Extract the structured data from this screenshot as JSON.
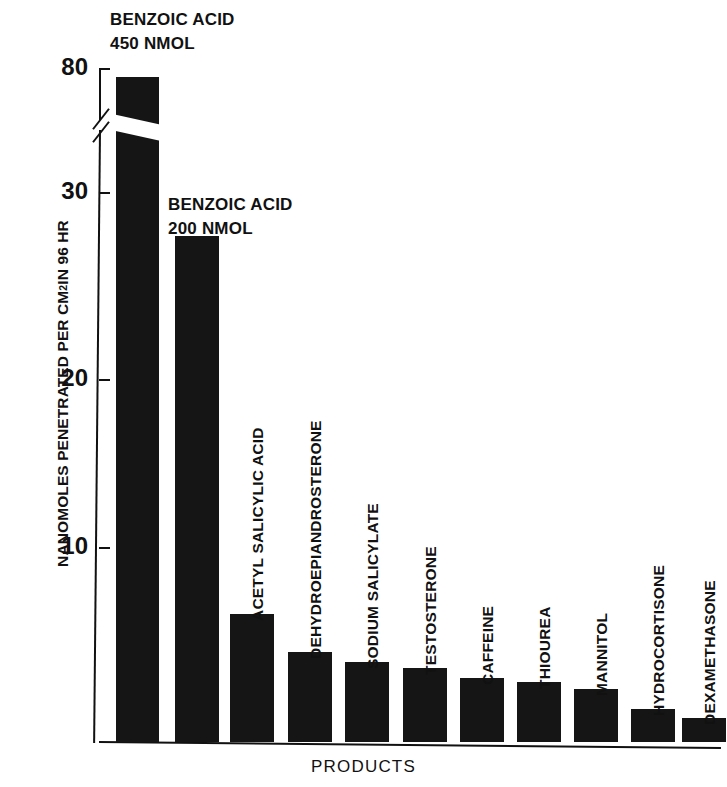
{
  "chart_data": {
    "type": "bar",
    "title": "",
    "xlabel": "PRODUCTS",
    "ylabel": "NANOMOLES PENETRATED PER CM2 IN 96 HR",
    "ylabel_prefix": "NANOMOLES PENETRATED PER CM",
    "ylabel_super": "2",
    "ylabel_suffix": " IN 96 HR",
    "categories": [
      "BENZOIC ACID 450 NMOL",
      "BENZOIC ACID 200 NMOL",
      "ACETYL SALICYLIC ACID",
      "DEHYDROEPIANDROSTERONE",
      "SODIUM SALICYLATE",
      "TESTOSTERONE",
      "CAFFEINE",
      "THIOUREA",
      "MANNITOL",
      "HYDROCORTISONE",
      "DEXAMETHASONE"
    ],
    "values": [
      78,
      26.4,
      6.8,
      4.6,
      4.0,
      3.6,
      3.1,
      2.8,
      2.4,
      1.2,
      0.7
    ],
    "ytick_labels": [
      "80",
      "30",
      "20",
      "10"
    ],
    "ytick_values": [
      80,
      30,
      20,
      10
    ],
    "ylim": [
      0,
      80
    ],
    "axis_break": true,
    "axis_break_between": [
      30,
      80
    ],
    "grid": false,
    "legend": "none",
    "bar_color": "#151515",
    "annotations": [
      "BENZOIC ACID\n450 NMOL",
      "BENZOIC ACID\n200 NMOL"
    ]
  },
  "axis": {
    "ticks": [
      {
        "label": "80",
        "y": 68
      },
      {
        "label": "30",
        "y": 192
      },
      {
        "label": "20",
        "y": 379
      },
      {
        "label": "10",
        "y": 547
      }
    ]
  },
  "bars": [
    {
      "name": "benzoic-acid-450",
      "label": "",
      "x": 116,
      "w": 43,
      "top": 77
    },
    {
      "name": "benzoic-acid-200",
      "label": "",
      "x": 175,
      "w": 44,
      "top": 236
    },
    {
      "name": "acetyl-salicylic-acid",
      "label": "ACETYL SALICYLIC ACID",
      "x": 230,
      "w": 44,
      "top": 614,
      "label_bottom": 603
    },
    {
      "name": "dehydroepiandrosterone",
      "label": "DEHYDROEPIANDROSTERONE",
      "x": 288,
      "w": 44,
      "top": 652,
      "label_bottom": 641
    },
    {
      "name": "sodium-salicylate",
      "label": "SODIUM SALICYLATE",
      "x": 345,
      "w": 44,
      "top": 662,
      "label_bottom": 651
    },
    {
      "name": "testosterone",
      "label": "TESTOSTERONE",
      "x": 403,
      "w": 44,
      "top": 668,
      "label_bottom": 657
    },
    {
      "name": "caffeine",
      "label": "CAFFEINE",
      "x": 460,
      "w": 44,
      "top": 678,
      "label_bottom": 667
    },
    {
      "name": "thiourea",
      "label": "THIOUREA",
      "x": 517,
      "w": 44,
      "top": 682,
      "label_bottom": 671
    },
    {
      "name": "mannitol",
      "label": "MANNITOL",
      "x": 574,
      "w": 44,
      "top": 689,
      "label_bottom": 678
    },
    {
      "name": "hydrocortisone",
      "label": "HYDROCORTISONE",
      "x": 631,
      "w": 44,
      "top": 709,
      "label_bottom": 698
    },
    {
      "name": "dexamethasone",
      "label": "DEXAMETHASONE",
      "x": 682,
      "w": 44,
      "top": 718,
      "label_bottom": 707
    }
  ],
  "annotations": [
    {
      "name": "annotation-benzoic-450",
      "text": "BENZOIC ACID\n450 NMOL",
      "x": 110,
      "y": 8
    },
    {
      "name": "annotation-benzoic-200",
      "text": "BENZOIC ACID\n200 NMOL",
      "x": 168,
      "y": 193
    }
  ]
}
